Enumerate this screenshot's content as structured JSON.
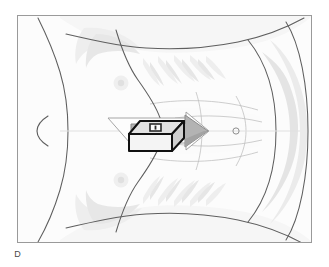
{
  "figure": {
    "panel_label": "D",
    "caption_visible": false,
    "frame": {
      "border_color": "#9a9a9a",
      "border_width_px": 1,
      "x": 17,
      "y": 15,
      "width": 295,
      "height": 228,
      "fill_color": "#fdfdfd"
    },
    "background_color": "#ffffff"
  },
  "illustration": {
    "subject": "human torso anterior view",
    "description": "faint line drawing of a chest and abdomen with rib cage, nipples and navel",
    "line_color": "#6f6f6f",
    "shadow_color": "#e9e9e9",
    "skin_tone": "#fafafa",
    "landmarks": [
      {
        "name": "nipple-left",
        "cx": 121,
        "cy": 83,
        "r": 7
      },
      {
        "name": "nipple-right",
        "cx": 121,
        "cy": 180,
        "r": 7
      },
      {
        "name": "navel",
        "cx": 236,
        "cy": 131,
        "r": 3
      },
      {
        "name": "neck-curve",
        "cx": 40,
        "cy": 129,
        "r": 14
      }
    ]
  },
  "overlay": {
    "arrow": {
      "label": "direction-of-insertion",
      "direction": "right",
      "fill_color": "#b3b3b3",
      "highlight_color": "#fdfdfd",
      "outline_color": "#8a8a8a",
      "tail_x": 108,
      "tip_x": 209,
      "center_y": 131
    },
    "box": {
      "label": "device",
      "shape": "isometric-rectangular-box",
      "outline_color": "#111111",
      "top_face_color": "#e2e2e2",
      "front_face_color": "#f4f4f4",
      "side_face_color": "#cfcfcf",
      "marker_color": "#2a2a2a",
      "x": 129,
      "y": 121,
      "width": 55,
      "height": 34
    }
  }
}
